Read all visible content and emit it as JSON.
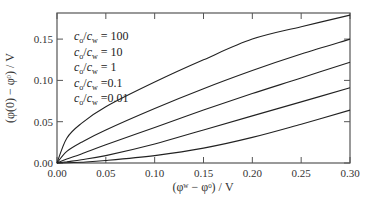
{
  "chart_data": {
    "type": "line",
    "title": "",
    "xlabel": "(φʷ − φᵒ) / V",
    "ylabel": "(φ(0) − φᵒ) / V",
    "xlim": [
      0.0,
      0.3
    ],
    "ylim": [
      0.0,
      0.18
    ],
    "grid": false,
    "legend_position": "upper-left (as text labels)",
    "x_ticks": [
      "0.00",
      "0.05",
      "0.10",
      "0.15",
      "0.20",
      "0.25",
      "0.30"
    ],
    "y_ticks": [
      "0.00",
      "0.05",
      "0.10",
      "0.15"
    ],
    "x": [
      0.0,
      0.01,
      0.025,
      0.05,
      0.1,
      0.15,
      0.2,
      0.25,
      0.3
    ],
    "series": [
      {
        "name": "c_o/c_w = 100",
        "values": [
          0.0,
          0.03,
          0.048,
          0.068,
          0.098,
          0.125,
          0.15,
          0.165,
          0.179
        ]
      },
      {
        "name": "c_o/c_w = 10",
        "values": [
          0.0,
          0.014,
          0.025,
          0.04,
          0.066,
          0.09,
          0.112,
          0.132,
          0.15
        ]
      },
      {
        "name": "c_o/c_w = 1",
        "values": [
          0.0,
          0.005,
          0.011,
          0.022,
          0.043,
          0.064,
          0.084,
          0.103,
          0.122
        ]
      },
      {
        "name": "c_o/c_w = 0.1",
        "values": [
          0.0,
          0.0015,
          0.004,
          0.009,
          0.023,
          0.04,
          0.057,
          0.074,
          0.091
        ]
      },
      {
        "name": "c_o/c_w = 0.01",
        "values": [
          0.0,
          0.0003,
          0.001,
          0.003,
          0.009,
          0.018,
          0.031,
          0.047,
          0.064
        ]
      }
    ]
  },
  "legend": [
    {
      "sub": "o",
      "rhs": "= 100"
    },
    {
      "sub": "o",
      "rhs": "= 10"
    },
    {
      "sub": "o",
      "rhs": "= 1"
    },
    {
      "sub": "o",
      "rhs": "=0.1"
    },
    {
      "sub": "o",
      "rhs": "=0.01"
    }
  ],
  "labels": {
    "x_axis": "(φʷ − φᵒ) / V",
    "y_axis": "(φ(0) − φᵒ) / V"
  },
  "colors": {
    "line": "#222222",
    "frame": "#555555",
    "background": "#ffffff"
  }
}
